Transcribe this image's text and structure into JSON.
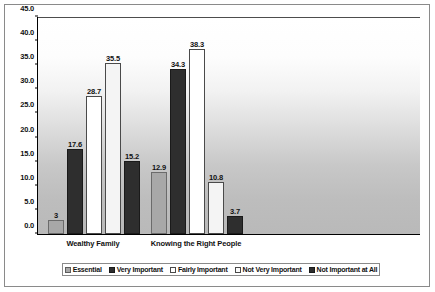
{
  "chart_data": {
    "type": "bar",
    "title": "",
    "subtitle": "",
    "xlabel": "",
    "ylabel": "",
    "ylim": [
      0,
      45
    ],
    "ytick_step": 5,
    "ytick_labels": [
      "0.0",
      "5.0",
      "10.0",
      "15.0",
      "20.0",
      "25.0",
      "30.0",
      "35.0",
      "40.0",
      "45.0"
    ],
    "ytick_values": [
      0,
      5,
      10,
      15,
      20,
      25,
      30,
      35,
      40,
      45
    ],
    "grid": false,
    "legend_position": "bottom",
    "categories": [
      "Wealthy Family",
      "Knowing the Right People"
    ],
    "series": [
      {
        "name": "Essential",
        "values": [
          3,
          12.9
        ],
        "labels": [
          "3",
          "12.9"
        ]
      },
      {
        "name": "Very Important",
        "values": [
          17.6,
          34.3
        ],
        "labels": [
          "17.6",
          "34.3"
        ]
      },
      {
        "name": "Fairly Important",
        "values": [
          28.7,
          38.3
        ],
        "labels": [
          "28.7",
          "38.3"
        ]
      },
      {
        "name": "Not Very Important",
        "values": [
          35.5,
          10.8
        ],
        "labels": [
          "35.5",
          "10.8"
        ]
      },
      {
        "name": "Not Important at All",
        "values": [
          15.2,
          3.7
        ],
        "labels": [
          "15.2",
          "3.7"
        ]
      }
    ]
  },
  "legend": {
    "items": [
      {
        "label": "Essential"
      },
      {
        "label": "Very Important"
      },
      {
        "label": "Fairly Important"
      },
      {
        "label": "Not Very Important"
      },
      {
        "label": "Not Important at All"
      }
    ]
  },
  "colors": {
    "essential": "#a8a8a8",
    "very_important": "#2e2e2e",
    "fairly_important": "#ffffff",
    "not_very_important": "#f4f4f4",
    "not_important_at_all": "#2e2e2e",
    "axis": "#000000",
    "frame": "#8a8a8a"
  }
}
